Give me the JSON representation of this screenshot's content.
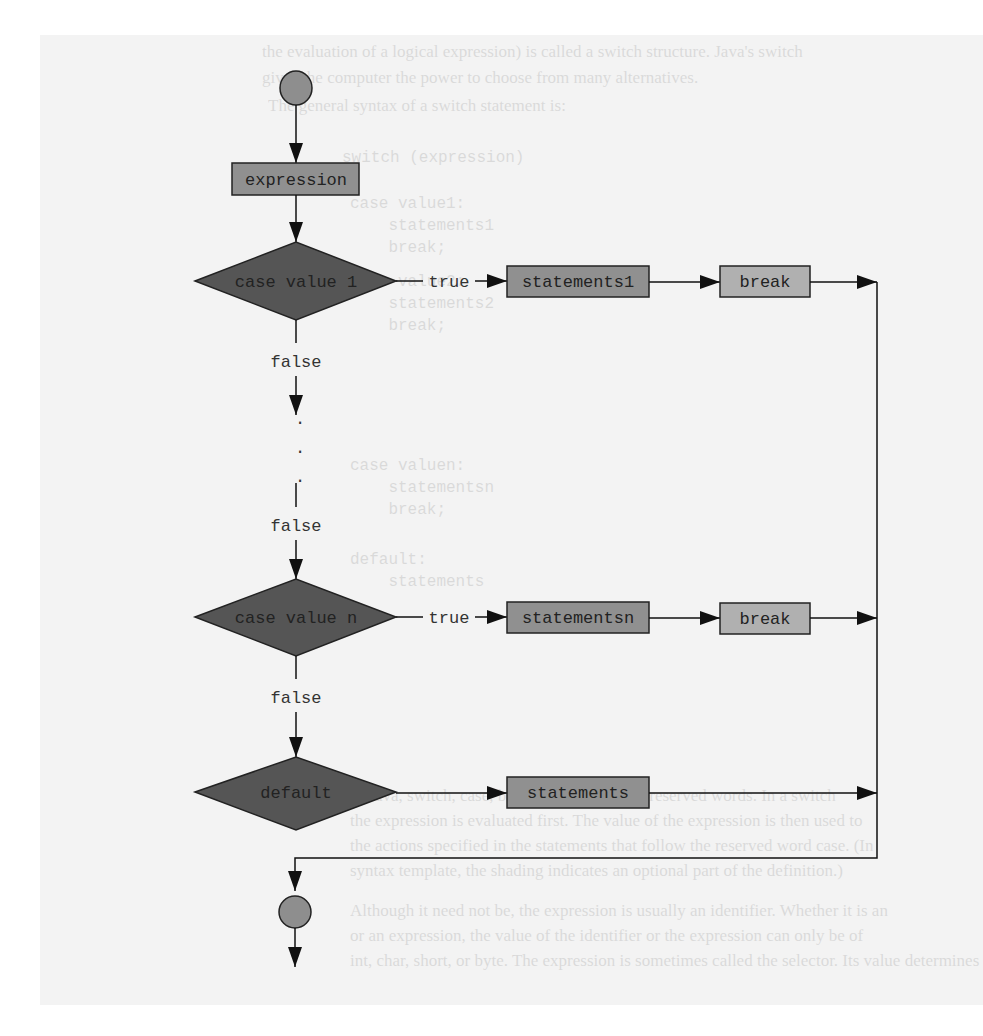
{
  "background_page": {
    "lines": [
      {
        "text": "the evaluation of a logical expression) is called a switch structure. Java's switch",
        "x": 262,
        "y": 6,
        "mono": false
      },
      {
        "text": "gives the computer the power to choose from many alternatives.",
        "x": 262,
        "y": 32,
        "mono": false
      },
      {
        "text": "The general syntax of a switch statement is:",
        "x": 268,
        "y": 60,
        "mono": false
      },
      {
        "text": "switch (expression)",
        "x": 342,
        "y": 112,
        "mono": true
      },
      {
        "text": "{",
        "x": 342,
        "y": 134,
        "mono": true
      },
      {
        "text": "case value1:",
        "x": 350,
        "y": 158,
        "mono": true
      },
      {
        "text": "    statements1",
        "x": 350,
        "y": 180,
        "mono": true
      },
      {
        "text": "    break;",
        "x": 350,
        "y": 202,
        "mono": true
      },
      {
        "text": "case value2:",
        "x": 350,
        "y": 236,
        "mono": true
      },
      {
        "text": "    statements2",
        "x": 350,
        "y": 258,
        "mono": true
      },
      {
        "text": "    break;",
        "x": 350,
        "y": 280,
        "mono": true
      },
      {
        "text": "case valuen:",
        "x": 350,
        "y": 420,
        "mono": true
      },
      {
        "text": "    statementsn",
        "x": 350,
        "y": 442,
        "mono": true
      },
      {
        "text": "    break;",
        "x": 350,
        "y": 464,
        "mono": true
      },
      {
        "text": "default:",
        "x": 350,
        "y": 514,
        "mono": true
      },
      {
        "text": "    statements",
        "x": 350,
        "y": 536,
        "mono": true
      },
      {
        "text": "In Java, switch, case, break, and default are reserved words. In a switch",
        "x": 350,
        "y": 750,
        "mono": false
      },
      {
        "text": "the expression is evaluated first. The value of the expression is then used to",
        "x": 350,
        "y": 775,
        "mono": false
      },
      {
        "text": "the actions specified in the statements that follow the reserved word case. (In",
        "x": 350,
        "y": 800,
        "mono": false
      },
      {
        "text": "syntax template, the shading indicates an optional part of the definition.)",
        "x": 350,
        "y": 825,
        "mono": false
      },
      {
        "text": "Although it need not be, the expression is usually an identifier. Whether it is an",
        "x": 350,
        "y": 865,
        "mono": false
      },
      {
        "text": "or an expression, the value of the identifier or the expression can only be of",
        "x": 350,
        "y": 890,
        "mono": false
      },
      {
        "text": "int, char, short, or byte. The expression is sometimes called the selector. Its value determines",
        "x": 350,
        "y": 915,
        "mono": false
      }
    ]
  },
  "flowchart": {
    "colors": {
      "terminal_fill": "#8e8e8e",
      "process_fill": "#909090",
      "break_fill": "#b0b0b0",
      "decision_fill": "#555555",
      "stroke": "#222222",
      "page_bg": "#f3f3f3"
    },
    "start_node": {
      "label": ""
    },
    "expression_node": {
      "label": "expression"
    },
    "decisions": [
      {
        "label": "case value 1",
        "true_label": "true",
        "false_label": "false",
        "statements": "statements1",
        "break": "break"
      },
      {
        "label": "case value n",
        "true_label": "true",
        "false_label": "false",
        "statements": "statementsn",
        "break": "break"
      }
    ],
    "ellipsis": ".",
    "middle_false_label": "false",
    "default_node": {
      "label": "default",
      "statements": "statements"
    },
    "end_node": {
      "label": ""
    }
  }
}
